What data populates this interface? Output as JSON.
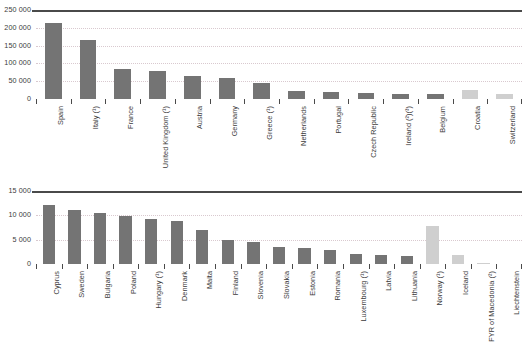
{
  "chart_data": [
    {
      "type": "bar",
      "title": "",
      "xlabel": "",
      "ylabel": "",
      "ylim": [
        0,
        250000
      ],
      "yticks": [
        0,
        50000,
        100000,
        150000,
        200000,
        250000
      ],
      "ytick_labels": [
        "0",
        "50 000",
        "100 000",
        "150 000",
        "200 000",
        "250 000"
      ],
      "grid": true,
      "legend": "none",
      "categories": [
        "Spain",
        "Italy (¹)",
        "France",
        "United Kingdom (¹)",
        "Austria",
        "Germany",
        "Greece (¹)",
        "Netherlands",
        "Portugal",
        "Czech Republic",
        "Ireland (²)(³)",
        "Belgium",
        "Croatia",
        "Switzerland"
      ],
      "values": [
        213000,
        167000,
        84000,
        79000,
        65000,
        58000,
        46000,
        22000,
        21000,
        16000,
        15000,
        13000,
        24000,
        14000
      ],
      "bar_colors": [
        "#747474",
        "#747474",
        "#747474",
        "#747474",
        "#747474",
        "#747474",
        "#747474",
        "#747474",
        "#747474",
        "#747474",
        "#747474",
        "#747474",
        "#cfcfcf",
        "#cfcfcf"
      ]
    },
    {
      "type": "bar",
      "title": "",
      "xlabel": "",
      "ylabel": "",
      "ylim": [
        0,
        15000
      ],
      "yticks": [
        0,
        5000,
        10000,
        15000
      ],
      "ytick_labels": [
        "0",
        "5 000",
        "10 000",
        "15 000"
      ],
      "grid": true,
      "legend": "none",
      "categories": [
        "Cyprus",
        "Sweden",
        "Bulgaria",
        "Poland",
        "Hungary (¹)",
        "Denmark",
        "Malta",
        "Finland",
        "Slovenia",
        "Slovakia",
        "Estonia",
        "Romania",
        "Luxembourg (¹)",
        "Latvia",
        "Lithuania",
        "Norway (¹)",
        "Iceland",
        "FYR of Macedonia (²)",
        "Liechtenstein"
      ],
      "values": [
        12200,
        11000,
        10400,
        9900,
        9200,
        8800,
        7000,
        4900,
        4500,
        3500,
        3200,
        2800,
        2100,
        1900,
        1700,
        7800,
        1900,
        200,
        0
      ],
      "bar_colors": [
        "#747474",
        "#747474",
        "#747474",
        "#747474",
        "#747474",
        "#747474",
        "#747474",
        "#747474",
        "#747474",
        "#747474",
        "#747474",
        "#747474",
        "#747474",
        "#747474",
        "#747474",
        "#cfcfcf",
        "#cfcfcf",
        "#cfcfcf",
        "#cfcfcf"
      ]
    }
  ],
  "style": {
    "bar_color_primary": "#747474",
    "bar_color_secondary": "#cfcfcf",
    "gridline_color": "#d9c9cf",
    "axis_color": "#4a4a4a",
    "text_color": "#3b3b3b",
    "background": "#ffffff"
  }
}
